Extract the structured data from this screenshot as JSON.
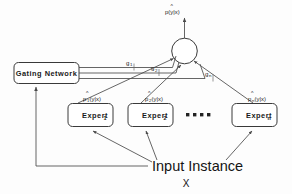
{
  "diagram": {
    "output": {
      "label": "p(y|x)",
      "hat": "^",
      "name": "combined-output"
    },
    "combiner": {
      "label": "",
      "shape": "circle"
    },
    "gating": {
      "label": "Gating Network"
    },
    "gates": [
      {
        "label": "g",
        "sub": "1"
      },
      {
        "label": "g",
        "sub": "2"
      },
      {
        "label": "g",
        "sub": "n"
      }
    ],
    "experts": [
      {
        "label": "Expert",
        "sub": "1",
        "output": "p",
        "output_sub": "1",
        "output_args": "(y|x)",
        "hat": "^"
      },
      {
        "label": "Expert",
        "sub": "2",
        "output": "p",
        "output_sub": "2",
        "output_args": "(y|x)",
        "hat": "^"
      },
      {
        "label": "Expert",
        "sub": "n",
        "output": "p",
        "output_sub": "n",
        "output_args": "(y|x)",
        "hat": "^"
      }
    ],
    "ellipsis": "▪ ▪ ▪ ▪",
    "input": {
      "label": "Input Instance",
      "variable": "X"
    },
    "colors": {
      "stroke": "#3a3a3a",
      "wire": "#4a4a4a",
      "text": "#1a1a1a",
      "background": "#fdfdfd"
    }
  }
}
